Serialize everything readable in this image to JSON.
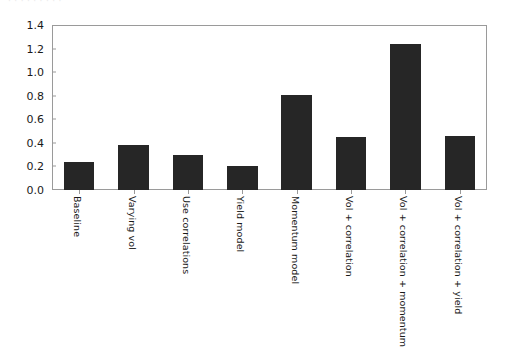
{
  "figure": {
    "top_fragment_text": "· · · · · · · · ·",
    "background_color": "#ffffff",
    "axis_color": "#9a9a9a",
    "bar_color": "#262626",
    "text_color": "#1a1a1a"
  },
  "chart_data": {
    "type": "bar",
    "title": "",
    "subtitle": "",
    "xlabel": "",
    "ylabel": "",
    "categories": [
      "Baseline",
      "Varying vol",
      "Use correlations",
      "Yield model",
      "Momentum model",
      "Vol + correlation",
      "Vol + correlation + momentum",
      "Vol + correlation + yield"
    ],
    "values": [
      0.24,
      0.38,
      0.3,
      0.2,
      0.81,
      0.45,
      1.24,
      0.46
    ],
    "ylim": [
      0.0,
      1.4
    ],
    "xlim": [
      0,
      8
    ],
    "yticks": [
      0.0,
      0.2,
      0.4,
      0.6,
      0.8,
      1.0,
      1.2,
      1.4
    ],
    "ytick_labels": [
      "0.0",
      "0.2",
      "0.4",
      "0.6",
      "0.8",
      "1.0",
      "1.2",
      "1.4"
    ],
    "grid": false,
    "legend": null,
    "legend_position": "none",
    "bar_color": "#262626",
    "xtick_label_rotation": 90,
    "annotations": []
  }
}
